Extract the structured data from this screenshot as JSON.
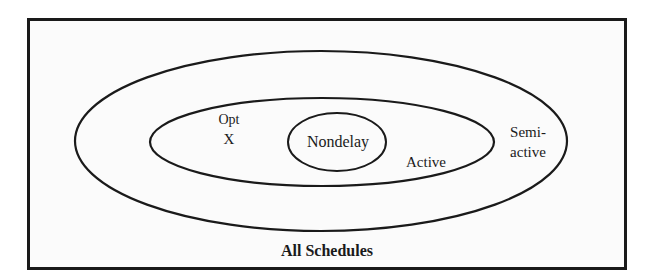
{
  "diagram": {
    "type": "nested-set-venn",
    "frame": {
      "label": "All Schedules"
    },
    "sets": [
      {
        "id": "semi-active",
        "label_line1": "Semi-",
        "label_line2": "active",
        "ellipse": {
          "cx": 321,
          "cy": 141,
          "rx": 246,
          "ry": 90
        }
      },
      {
        "id": "active",
        "label": "Active",
        "ellipse": {
          "cx": 322,
          "cy": 142,
          "rx": 172,
          "ry": 44
        }
      },
      {
        "id": "nondelay",
        "label": "Nondelay",
        "ellipse": {
          "cx": 337,
          "cy": 142,
          "rx": 49,
          "ry": 29
        }
      }
    ],
    "optimum_marker": {
      "label": "Opt",
      "symbol": "X"
    },
    "colors": {
      "stroke": "#1a1a1a",
      "background": "#fbfbfb",
      "text": "#1a1a1a"
    }
  }
}
